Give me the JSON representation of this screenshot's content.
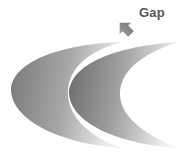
{
  "diagram": {
    "annotation": {
      "label": "Gap",
      "arrow_direction": "down-left"
    },
    "shapes": [
      {
        "name": "left-crescent",
        "fill_dark": "#7a7a7a",
        "fill_light": "#e4e4e4"
      },
      {
        "name": "right-crescent",
        "fill_dark": "#6e6e6e",
        "fill_light": "#e8e8e8"
      }
    ],
    "colors": {
      "label": "#555555",
      "arrow": "#8a8a8a",
      "background": "#ffffff"
    }
  }
}
